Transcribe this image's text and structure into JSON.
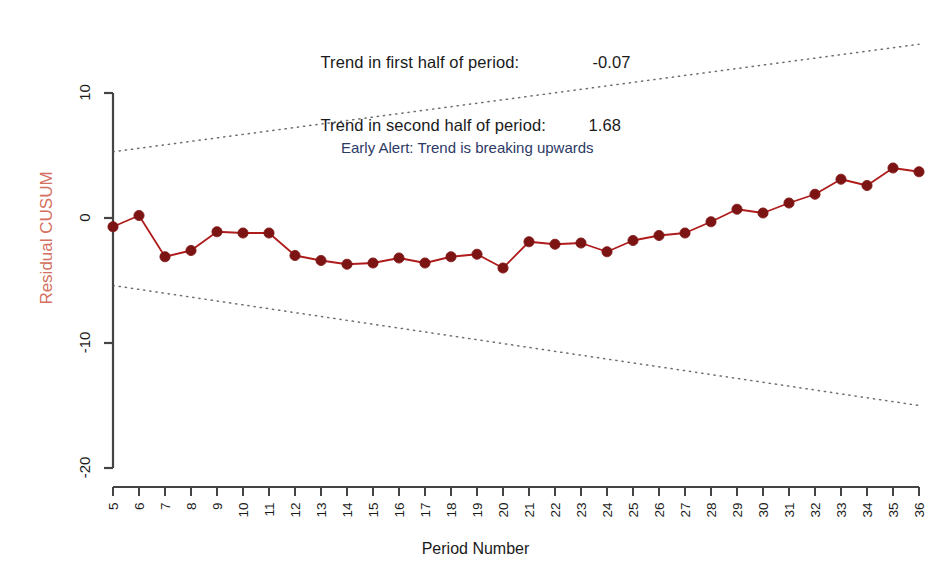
{
  "chart_data": {
    "type": "line",
    "title_lines": [
      {
        "label": "Trend in first half of period:",
        "value": "-0.07"
      },
      {
        "label": "Trend in second half of period:",
        "value": "1.68"
      }
    ],
    "annotations": [
      {
        "text": "Early Alert: Trend is breaking upwards",
        "color": "#2d3a66",
        "x": 16,
        "y": 5.1
      }
    ],
    "xlabel": "Period Number",
    "ylabel": "Residual CUSUM",
    "ylabel_color": "#d4705f",
    "xlim": [
      5,
      36
    ],
    "ylim": [
      -22.5,
      12.5
    ],
    "yticks": [
      10,
      0,
      -10,
      -20
    ],
    "ytick_labels": [
      "10",
      "0",
      "-10",
      "-20"
    ],
    "grid": false,
    "legend": null,
    "series": [
      {
        "name": "Residual CUSUM",
        "color": "#b01c1c",
        "marker": "filled-circle",
        "marker_color": "#7d1414",
        "x": [
          5,
          6,
          7,
          8,
          9,
          10,
          11,
          12,
          13,
          14,
          15,
          16,
          17,
          18,
          19,
          20,
          21,
          22,
          23,
          24,
          25,
          26,
          27,
          28,
          29,
          30,
          31,
          32,
          33,
          34,
          35,
          36
        ],
        "values": [
          -0.7,
          0.2,
          -3.1,
          -2.6,
          -1.1,
          -1.2,
          -1.2,
          -3.0,
          -3.4,
          -3.7,
          -3.6,
          -3.2,
          -3.6,
          -3.1,
          -2.9,
          -4.0,
          -1.9,
          -2.1,
          -2.0,
          -2.7,
          -1.8,
          -1.4,
          -1.2,
          -0.3,
          0.7,
          0.4,
          1.2,
          1.9,
          3.1,
          2.6,
          4.0,
          3.7
        ]
      }
    ],
    "boundaries": [
      {
        "name": "upper-boundary",
        "style": "dotted",
        "color": "#555555",
        "x": [
          5,
          36
        ],
        "values": [
          5.3,
          13.9
        ]
      },
      {
        "name": "lower-boundary",
        "style": "dotted",
        "color": "#555555",
        "x": [
          5,
          36
        ],
        "values": [
          -5.4,
          -15.0
        ]
      }
    ],
    "xtick_labels": [
      "5",
      "6",
      "7",
      "8",
      "9",
      "10",
      "11",
      "12",
      "13",
      "14",
      "15",
      "16",
      "17",
      "18",
      "19",
      "20",
      "21",
      "22",
      "23",
      "24",
      "25",
      "26",
      "27",
      "28",
      "29",
      "30",
      "31",
      "32",
      "33",
      "34",
      "35",
      "36"
    ],
    "axis_color": "#444444"
  }
}
